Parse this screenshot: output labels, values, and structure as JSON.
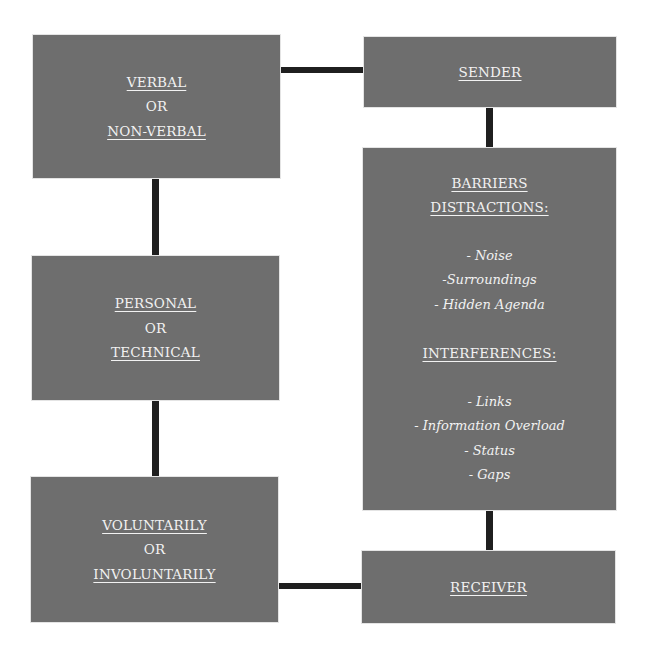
{
  "colors": {
    "box_fill": "#6e6e6e",
    "box_text": "#f2f2f2",
    "connector": "#1f1f1f",
    "background": "#ffffff"
  },
  "boxes": {
    "verbal": {
      "lines": [
        "VERBAL",
        "OR",
        "NON-VERBAL"
      ]
    },
    "sender": {
      "lines": [
        "SENDER"
      ]
    },
    "barriers": {
      "heading": [
        "BARRIERS",
        "DISTRACTIONS:"
      ],
      "distractions": [
        "- Noise",
        "-Surroundings",
        "- Hidden Agenda"
      ],
      "interferences_heading": "INTERFERENCES:",
      "interferences": [
        "- Links",
        "- Information Overload",
        "- Status",
        "- Gaps"
      ]
    },
    "personal": {
      "lines": [
        "PERSONAL",
        "OR",
        "TECHNICAL"
      ]
    },
    "voluntarily": {
      "lines": [
        "VOLUNTARILY",
        "OR",
        "INVOLUNTARILY"
      ]
    },
    "receiver": {
      "lines": [
        "RECEIVER"
      ]
    }
  },
  "connections": [
    [
      "verbal",
      "sender"
    ],
    [
      "sender",
      "barriers"
    ],
    [
      "barriers",
      "receiver"
    ],
    [
      "verbal",
      "personal"
    ],
    [
      "personal",
      "voluntarily"
    ],
    [
      "voluntarily",
      "receiver"
    ]
  ]
}
